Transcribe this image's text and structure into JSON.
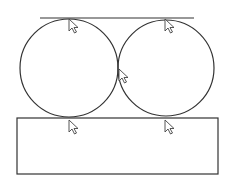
{
  "diagram": {
    "stroke_color": "#333333",
    "background": "#ffffff",
    "top_line": {
      "x1": 40,
      "y1": 18,
      "x2": 194,
      "y2": 18
    },
    "circles": [
      {
        "id": "left",
        "cx": 69,
        "cy": 68,
        "r": 49
      },
      {
        "id": "right",
        "cx": 166,
        "cy": 68,
        "r": 48
      }
    ],
    "rectangle": {
      "x": 17,
      "y": 118,
      "width": 201,
      "height": 56
    },
    "cursors": [
      {
        "id": "left-top",
        "x": 69,
        "y": 19
      },
      {
        "id": "right-top",
        "x": 165,
        "y": 19
      },
      {
        "id": "middle",
        "x": 119,
        "y": 69
      },
      {
        "id": "left-bottom",
        "x": 69,
        "y": 120
      },
      {
        "id": "right-bottom",
        "x": 165,
        "y": 120
      }
    ]
  }
}
